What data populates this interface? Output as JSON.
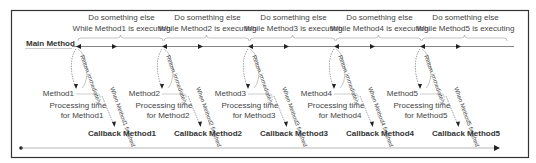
{
  "diagram": {
    "main_label": "Main Method",
    "colors": {
      "frame": "#333333",
      "line": "#555555",
      "text": "#444444"
    },
    "segments": [
      {
        "x": 104,
        "do_something": "Do something else",
        "while_text": "While Method1 is executing",
        "return_label": "Return immediately",
        "method_label": "Method1",
        "processing": "Processing time",
        "processing_for": "for Method1",
        "when_finished": "When Method1 finished",
        "callback": "Callback Method1"
      },
      {
        "x": 190,
        "do_something": "Do something else",
        "while_text": "While Method2 is executing",
        "return_label": "Return immediately",
        "method_label": "Method2",
        "processing": "Processing time",
        "processing_for": "for Method2",
        "when_finished": "When Method2 finished",
        "callback": "Callback Method2"
      },
      {
        "x": 276,
        "do_something": "Do something else",
        "while_text": "While Method3 is executing",
        "return_label": "Return immediately",
        "method_label": "Method3",
        "processing": "Processing time",
        "processing_for": "for Method3",
        "when_finished": "When Method3 finished",
        "callback": "Callback Method3"
      },
      {
        "x": 362,
        "do_something": "Do something else",
        "while_text": "While Method4 is executing",
        "return_label": "Return immediately",
        "method_label": "Method4",
        "processing": "Processing time",
        "processing_for": "for Method4",
        "when_finished": "When Method4 finished",
        "callback": "Callback Method4"
      },
      {
        "x": 448,
        "do_something": "Do something else",
        "while_text": "While Method5 is executing",
        "return_label": "Return immediately",
        "method_label": "Method5",
        "processing": "Processing time",
        "processing_for": "for Method5",
        "when_finished": "When Method5 finished",
        "callback": "Callback Method5"
      }
    ]
  }
}
